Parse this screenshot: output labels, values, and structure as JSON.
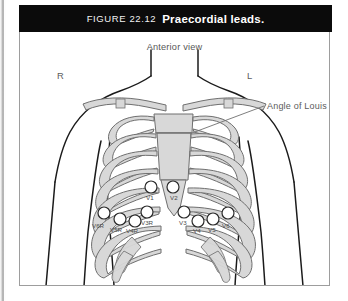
{
  "figure": {
    "number_label": "FIGURE 22.12",
    "title": "Praecordial leads.",
    "view_label": "Anterior view",
    "side_right_label": "R",
    "side_left_label": "L",
    "annotation_label": "Angle of Louis"
  },
  "colors": {
    "title_bar_bg": "#0b0b0b",
    "title_text": "#ffffff",
    "figure_border": "#9d9d9d",
    "outline_stroke": "#1b1b1b",
    "bone_fill": "#d8d8d8",
    "bone_stroke": "#6f6f6f",
    "electrode_stroke": "#2a2a2a",
    "electrode_fill": "#ffffff",
    "label_text": "#5c5c5c",
    "page_background": "#ffffff"
  },
  "electrodes": {
    "right_side": [
      {
        "id": "V1",
        "label": "V1",
        "cx": 131,
        "cy": 155,
        "r": 6.0,
        "lx": 126,
        "ly": 168
      },
      {
        "id": "V6R",
        "label": "V6R",
        "cx": 84,
        "cy": 181,
        "r": 6.0,
        "lx": 72,
        "ly": 196
      },
      {
        "id": "V5R",
        "label": "V5R",
        "cx": 100,
        "cy": 187,
        "r": 6.0,
        "lx": 90,
        "ly": 200
      },
      {
        "id": "V4R",
        "label": "V4R",
        "cx": 115,
        "cy": 189,
        "r": 6.0,
        "lx": 106,
        "ly": 201
      },
      {
        "id": "V3R",
        "label": "V3R",
        "cx": 127,
        "cy": 180,
        "r": 6.0,
        "lx": 121,
        "ly": 193
      }
    ],
    "left_side": [
      {
        "id": "V2",
        "label": "V2",
        "cx": 153,
        "cy": 155,
        "r": 6.0,
        "lx": 150,
        "ly": 168
      },
      {
        "id": "V3",
        "label": "V3",
        "cx": 164,
        "cy": 180,
        "r": 6.0,
        "lx": 159,
        "ly": 193
      },
      {
        "id": "V4",
        "label": "V4",
        "cx": 178,
        "cy": 189,
        "r": 6.0,
        "lx": 173,
        "ly": 201
      },
      {
        "id": "V5",
        "label": "V5",
        "cx": 193,
        "cy": 187,
        "r": 6.0,
        "lx": 188,
        "ly": 200
      },
      {
        "id": "V6",
        "label": "V6",
        "cx": 208,
        "cy": 181,
        "r": 6.0,
        "lx": 202,
        "ly": 196
      }
    ]
  },
  "anatomy": {
    "ribs_per_side": 7,
    "structures": [
      "neck",
      "shoulders",
      "arms",
      "clavicles",
      "sternum",
      "ribs",
      "costal-cartilages"
    ]
  }
}
